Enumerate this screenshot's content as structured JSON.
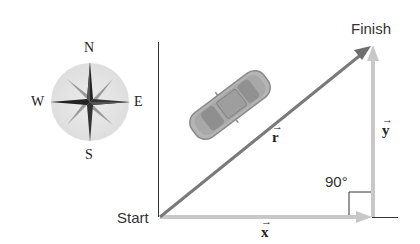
{
  "compass": {
    "north": "N",
    "south": "S",
    "east": "E",
    "west": "W"
  },
  "labels": {
    "start": "Start",
    "finish": "Finish",
    "angle": "90°"
  },
  "vectors": {
    "r": "r",
    "x": "x",
    "y": "y",
    "arrow": "→"
  },
  "colors": {
    "resultant": "#7a7a7a",
    "components": "#c8c8c8",
    "axis": "#333333",
    "compass_disc": "#e6e6e6"
  }
}
